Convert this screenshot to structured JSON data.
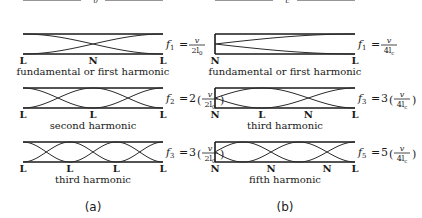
{
  "figure": {
    "panels": [
      {
        "id": "a",
        "label": "(a)",
        "pipe_type": "open at both ends",
        "length_label": "l",
        "length_subscript": "0",
        "rows": [
          {
            "caption": "fundamental or first harmonic",
            "node_labels": [
              "L",
              "N",
              "L"
            ],
            "freq_lhs": "f",
            "freq_sub": "1",
            "multiplier": "",
            "num": "v",
            "den": "2l",
            "den_sub": "0",
            "harmonic": 1
          },
          {
            "caption": "second harmonic",
            "node_labels": [
              "L",
              "L",
              "L"
            ],
            "freq_lhs": "f",
            "freq_sub": "2",
            "multiplier": "2",
            "num": "v",
            "den": "2l",
            "den_sub": "0",
            "harmonic": 2
          },
          {
            "caption": "third harmonic",
            "node_labels": [
              "L",
              "L",
              "L",
              "L"
            ],
            "freq_lhs": "f",
            "freq_sub": "3",
            "multiplier": "3",
            "num": "v",
            "den": "2l",
            "den_sub": "0",
            "harmonic": 3
          }
        ]
      },
      {
        "id": "b",
        "label": "(b)",
        "pipe_type": "closed at one end",
        "length_label": "l",
        "length_subscript": "c",
        "rows": [
          {
            "caption": "fundamental or first harmonic",
            "node_labels": [
              "N",
              "L"
            ],
            "freq_lhs": "f",
            "freq_sub": "1",
            "multiplier": "",
            "num": "v",
            "den": "4l",
            "den_sub": "c",
            "harmonic": 1
          },
          {
            "caption": "third harmonic",
            "node_labels": [
              "N",
              "L",
              "N",
              "L"
            ],
            "freq_lhs": "f",
            "freq_sub": "3",
            "multiplier": "3",
            "num": "v",
            "den": "4l",
            "den_sub": "c",
            "harmonic": 3
          },
          {
            "caption": "fifth harmonic",
            "node_labels": [
              "N",
              "N",
              "N",
              "L"
            ],
            "freq_lhs": "f",
            "freq_sub": "5",
            "multiplier": "5",
            "num": "v",
            "den": "4l",
            "den_sub": "c",
            "harmonic": 5
          }
        ]
      }
    ]
  }
}
